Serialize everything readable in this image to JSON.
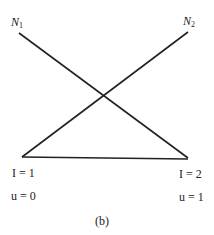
{
  "diagram": {
    "nodes": {
      "n1": {
        "symbol": "N",
        "subscript": "1"
      },
      "n2": {
        "symbol": "N",
        "subscript": "2"
      }
    },
    "left_node": {
      "I_label": "I = 1",
      "u_label": "u = 0"
    },
    "right_node": {
      "I_label": "I = 2",
      "u_label": "u = 1"
    },
    "caption": "(b)",
    "line_color": "#222222"
  }
}
